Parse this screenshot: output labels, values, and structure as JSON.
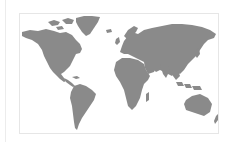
{
  "map": {
    "type": "world-map",
    "projection": "equirectangular",
    "style": "grayscale",
    "colors": {
      "land": "#8a8a8a",
      "water": "#ffffff",
      "frame_border": "#e6e6e6",
      "divider": "#ececec"
    },
    "regions": [
      {
        "name": "North America"
      },
      {
        "name": "Greenland"
      },
      {
        "name": "South America"
      },
      {
        "name": "Europe"
      },
      {
        "name": "Africa"
      },
      {
        "name": "Asia"
      },
      {
        "name": "Australia"
      },
      {
        "name": "Indonesia"
      },
      {
        "name": "New Zealand"
      },
      {
        "name": "Madagascar"
      },
      {
        "name": "Japan"
      }
    ]
  }
}
